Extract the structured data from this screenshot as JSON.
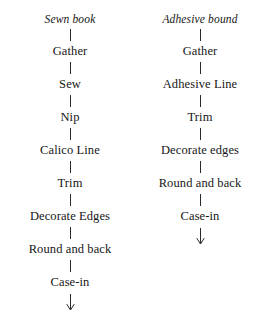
{
  "diagram": {
    "type": "flowchart",
    "orientation": "vertical",
    "columns": [
      {
        "heading": "Sewn book",
        "connector_icon": "vertical-line-connector",
        "terminal_icon": "down-arrow-icon",
        "steps": [
          "Gather",
          "Sew",
          "Nip",
          "Calico Line",
          "Trim",
          "Decorate Edges",
          "Round and back",
          "Case-in"
        ]
      },
      {
        "heading": "Adhesive bound",
        "connector_icon": "vertical-line-connector",
        "terminal_icon": "down-arrow-icon",
        "steps": [
          "Gather",
          "Adhesive Line",
          "Trim",
          "Decorate edges",
          "Round and back",
          "Case-in"
        ]
      }
    ],
    "colors": {
      "background": "#ffffff",
      "text": "#161616",
      "line": "#2a2a2a"
    }
  }
}
